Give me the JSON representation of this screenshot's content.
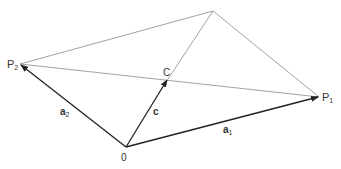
{
  "diagram": {
    "title": "",
    "points": {
      "O": {
        "x": 126,
        "y": 147,
        "label": "0"
      },
      "P1": {
        "x": 319,
        "y": 97,
        "label": "P",
        "sub": "1"
      },
      "P2": {
        "x": 20,
        "y": 64,
        "label": "P",
        "sub": "2"
      },
      "Q": {
        "x": 213,
        "y": 11,
        "label": ""
      },
      "C": {
        "x": 168,
        "y": 79,
        "label": "C"
      }
    },
    "vectors": [
      {
        "name": "a1",
        "from": "O",
        "to": "P1",
        "label": "a",
        "sub": "1"
      },
      {
        "name": "a2",
        "from": "O",
        "to": "P2",
        "label": "a",
        "sub": "2"
      },
      {
        "name": "c",
        "from": "O",
        "to": "C",
        "label": "c"
      }
    ],
    "thin_lines": [
      {
        "from": "P2",
        "to": "Q"
      },
      {
        "from": "Q",
        "to": "P1"
      },
      {
        "from": "P2",
        "to": "P1"
      },
      {
        "from": "C",
        "to": "Q"
      }
    ],
    "labels": {
      "p1_main": "P",
      "p1_sub": "1",
      "p2_main": "P",
      "p2_sub": "2",
      "c_point": "C",
      "origin": "0",
      "a1_main": "a",
      "a1_sub": "1",
      "a2_main": "a",
      "a2_sub": "2",
      "c_vec": "c"
    },
    "colors": {
      "vector": "#222222",
      "thin": "#8a8a8a",
      "text": "#333333"
    }
  }
}
